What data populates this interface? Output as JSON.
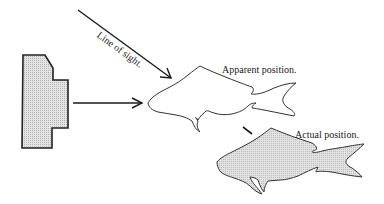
{
  "diagram": {
    "type": "refraction-illustration",
    "labels": {
      "line_of_sight": "Line of sight.",
      "apparent_position": "Apparent position.",
      "actual_position": "Actual position."
    },
    "elements": [
      {
        "name": "observer-block",
        "fill": "#cfcfcf",
        "stroke": "#222222"
      },
      {
        "name": "line-of-sight-arrow",
        "stroke": "#1a1a1a"
      },
      {
        "name": "horizontal-arrow",
        "stroke": "#1a1a1a"
      },
      {
        "name": "apparent-fish",
        "fill": "#ffffff",
        "stroke": "#333333"
      },
      {
        "name": "actual-fish",
        "fill": "#d6d6d6",
        "stroke": "#333333"
      }
    ]
  }
}
